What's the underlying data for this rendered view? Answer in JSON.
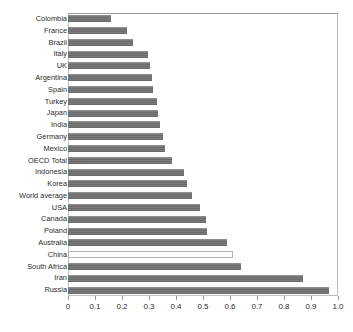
{
  "chart_data": {
    "type": "bar",
    "orientation": "horizontal",
    "title": "",
    "xlabel": "",
    "ylabel": "",
    "xlim": [
      0,
      1.0
    ],
    "xticks": [
      "0",
      "0.1",
      "0.2",
      "0.3",
      "0.4",
      "0.5",
      "0.6",
      "0.7",
      "0.8",
      "0.9",
      "1.0"
    ],
    "xtick_values": [
      0,
      0.1,
      0.2,
      0.3,
      0.4,
      0.5,
      0.6,
      0.7,
      0.8,
      0.9,
      1.0
    ],
    "grid": false,
    "legend": "none",
    "bar_color": "#6f6f6f",
    "highlight_color": "#fdfdfd",
    "highlight_category": "China",
    "categories": [
      "Colombia",
      "France",
      "Brazil",
      "Italy",
      "UK",
      "Argentina",
      "Spain",
      "Turkey",
      "Japan",
      "India",
      "Germany",
      "Mexico",
      "OECD Total",
      "Indonesia",
      "Korea",
      "World average",
      "USA",
      "Canada",
      "Poland",
      "Australia",
      "China",
      "South Africa",
      "Iran",
      "Russia"
    ],
    "values": [
      0.16,
      0.22,
      0.24,
      0.295,
      0.305,
      0.31,
      0.315,
      0.33,
      0.335,
      0.34,
      0.35,
      0.36,
      0.385,
      0.43,
      0.44,
      0.46,
      0.49,
      0.51,
      0.515,
      0.59,
      0.61,
      0.64,
      0.87,
      0.965
    ]
  },
  "ghost_text": ""
}
